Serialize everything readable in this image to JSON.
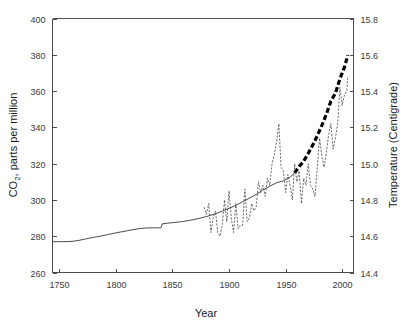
{
  "chart_data": {
    "type": "line",
    "title": "",
    "xlabel": "Year",
    "ylabel": "CO2, parts per million",
    "ylabel_pre": "CO",
    "ylabel_sub": "2",
    "ylabel_post": ", parts per million",
    "y2label": "Temperature (Centigrade)",
    "xlim": [
      1744,
      2010
    ],
    "ylim": [
      260,
      400
    ],
    "y2lim": [
      14.4,
      15.8
    ],
    "grid": false,
    "legend": "none",
    "xticks": [
      1750,
      1800,
      1850,
      1900,
      1950,
      2000
    ],
    "xticklabels": [
      "1750",
      "1800",
      "1850",
      "1900",
      "1950",
      "2000"
    ],
    "yticks": [
      260,
      280,
      300,
      320,
      340,
      360,
      380,
      400
    ],
    "yticklabels": [
      "260",
      "280",
      "300",
      "320",
      "340",
      "360",
      "380",
      "400"
    ],
    "y2ticks": [
      14.4,
      14.6,
      14.8,
      15.0,
      15.2,
      15.4,
      15.6,
      15.8
    ],
    "y2ticklabels": [
      "14.4",
      "14.6",
      "14.8",
      "15.0",
      "15.2",
      "15.4",
      "15.6",
      "15.8"
    ],
    "colors": {
      "co2": "#4a4a4a",
      "co2_recent": "#000000",
      "temperature": "#3d3d3d",
      "axis": "#4d4d4d",
      "background": "#ffffff"
    },
    "series": [
      {
        "name": "CO2 concentration (ice core + Mauna Loa)",
        "axis": "left",
        "style": "solid-thin",
        "unit": "ppm",
        "x": [
          1744,
          1750,
          1756,
          1762,
          1768,
          1774,
          1780,
          1786,
          1792,
          1798,
          1804,
          1810,
          1816,
          1822,
          1828,
          1834,
          1838,
          1840,
          1841,
          1846,
          1852,
          1858,
          1864,
          1870,
          1876,
          1882,
          1888,
          1894,
          1900,
          1906,
          1912,
          1918,
          1924,
          1930,
          1936,
          1942,
          1948,
          1954,
          1958
        ],
        "values": [
          277.0,
          277.0,
          277.0,
          277.2,
          277.8,
          278.6,
          279.3,
          280.0,
          280.8,
          281.6,
          282.3,
          283.0,
          283.7,
          284.3,
          284.6,
          284.6,
          284.6,
          284.7,
          286.8,
          287.2,
          287.6,
          288.0,
          288.6,
          289.3,
          290.2,
          291.2,
          292.4,
          293.8,
          295.4,
          297.0,
          299.0,
          301.0,
          303.0,
          305.5,
          307.5,
          309.5,
          310.5,
          312.5,
          315.0
        ]
      },
      {
        "name": "CO2 concentration recent (heavy dashed)",
        "axis": "left",
        "style": "dashed-heavy",
        "unit": "ppm",
        "x": [
          1958,
          1962,
          1966,
          1970,
          1974,
          1978,
          1982,
          1986,
          1990,
          1994,
          1998,
          2002,
          2005
        ],
        "values": [
          315.0,
          318.4,
          321.4,
          325.7,
          330.2,
          335.4,
          341.1,
          347.2,
          354.4,
          358.8,
          366.7,
          373.2,
          379.8
        ]
      },
      {
        "name": "Global mean temperature",
        "axis": "right",
        "style": "dashed-thin",
        "unit": "Centigrade",
        "x": [
          1878,
          1880,
          1882,
          1884,
          1886,
          1888,
          1890,
          1892,
          1894,
          1896,
          1898,
          1900,
          1902,
          1904,
          1906,
          1908,
          1910,
          1912,
          1914,
          1916,
          1918,
          1920,
          1922,
          1924,
          1926,
          1928,
          1930,
          1932,
          1934,
          1936,
          1938,
          1940,
          1942,
          1944,
          1946,
          1948,
          1950,
          1952,
          1954,
          1956,
          1958,
          1960,
          1962,
          1964,
          1966,
          1968,
          1970,
          1972,
          1974,
          1976,
          1978,
          1980,
          1982,
          1984,
          1986,
          1988,
          1990,
          1992,
          1994,
          1996,
          1998,
          2000,
          2002,
          2004,
          2005
        ],
        "values": [
          14.76,
          14.72,
          14.78,
          14.62,
          14.7,
          14.74,
          14.62,
          14.6,
          14.66,
          14.8,
          14.68,
          14.85,
          14.7,
          14.62,
          14.78,
          14.64,
          14.66,
          14.66,
          14.86,
          14.68,
          14.7,
          14.78,
          14.74,
          14.76,
          14.9,
          14.84,
          14.88,
          14.82,
          14.92,
          14.88,
          15.0,
          15.05,
          15.12,
          15.22,
          14.98,
          14.96,
          14.84,
          14.94,
          14.88,
          14.8,
          15.0,
          14.9,
          14.96,
          14.78,
          14.92,
          14.88,
          15.0,
          14.88,
          14.86,
          14.82,
          14.98,
          15.14,
          15.04,
          14.98,
          15.06,
          15.16,
          15.22,
          15.08,
          15.14,
          15.22,
          15.42,
          15.32,
          15.38,
          15.4,
          15.48
        ]
      }
    ]
  }
}
